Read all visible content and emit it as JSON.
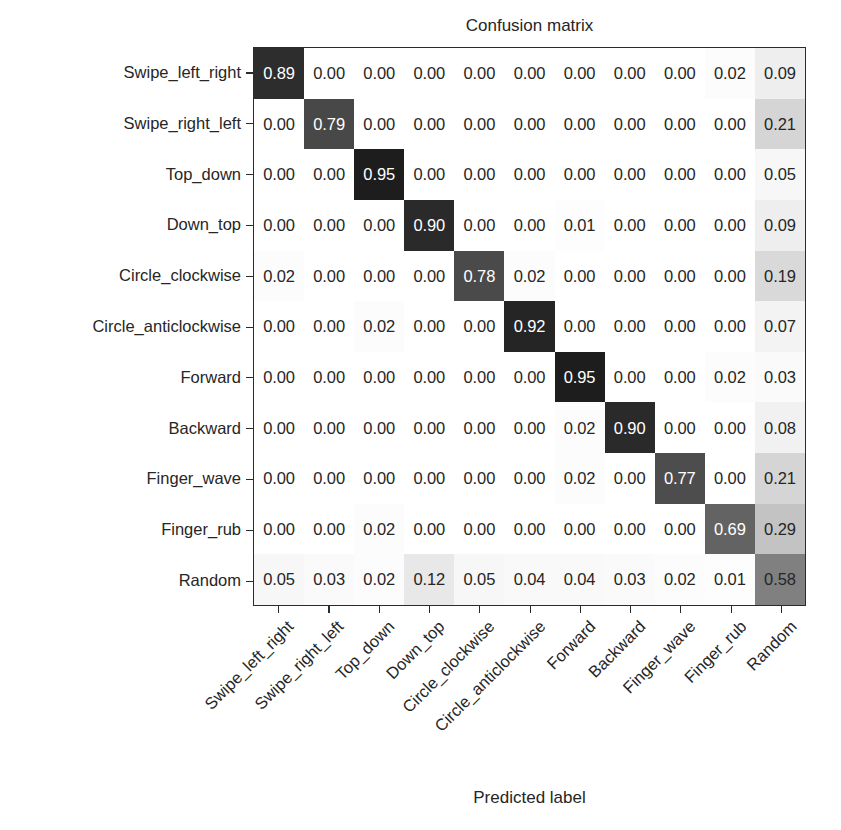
{
  "chart_data": {
    "type": "heatmap",
    "title": "Confusion matrix",
    "xlabel": "Predicted label",
    "ylabel": "True label",
    "colormap": "Greys",
    "normalized": true,
    "vmin": 0.0,
    "vmax": 1.0,
    "grid": false,
    "legend": "none",
    "categories": [
      "Swipe_left_right",
      "Swipe_right_left",
      "Top_down",
      "Down_top",
      "Circle_clockwise",
      "Circle_anticlockwise",
      "Forward",
      "Backward",
      "Finger_wave",
      "Finger_rub",
      "Random"
    ],
    "x_tick_labels": [
      "Swipe_left_right",
      "Swipe_right_left",
      "Top_down",
      "Down_top",
      "Circle_clockwise",
      "Circle_anticlockwise",
      "Forward",
      "Backward",
      "Finger_wave",
      "Finger_rub",
      "Random"
    ],
    "y_tick_labels": [
      "Swipe_left_right",
      "Swipe_right_left",
      "Top_down",
      "Down_top",
      "Circle_clockwise",
      "Circle_anticlockwise",
      "Forward",
      "Backward",
      "Finger_wave",
      "Finger_rub",
      "Random"
    ],
    "x_tick_rotation_deg": -45,
    "values": [
      [
        0.89,
        0.0,
        0.0,
        0.0,
        0.0,
        0.0,
        0.0,
        0.0,
        0.0,
        0.02,
        0.09
      ],
      [
        0.0,
        0.79,
        0.0,
        0.0,
        0.0,
        0.0,
        0.0,
        0.0,
        0.0,
        0.0,
        0.21
      ],
      [
        0.0,
        0.0,
        0.95,
        0.0,
        0.0,
        0.0,
        0.0,
        0.0,
        0.0,
        0.0,
        0.05
      ],
      [
        0.0,
        0.0,
        0.0,
        0.9,
        0.0,
        0.0,
        0.01,
        0.0,
        0.0,
        0.0,
        0.09
      ],
      [
        0.02,
        0.0,
        0.0,
        0.0,
        0.78,
        0.02,
        0.0,
        0.0,
        0.0,
        0.0,
        0.19
      ],
      [
        0.0,
        0.0,
        0.02,
        0.0,
        0.0,
        0.92,
        0.0,
        0.0,
        0.0,
        0.0,
        0.07
      ],
      [
        0.0,
        0.0,
        0.0,
        0.0,
        0.0,
        0.0,
        0.95,
        0.0,
        0.0,
        0.02,
        0.03
      ],
      [
        0.0,
        0.0,
        0.0,
        0.0,
        0.0,
        0.0,
        0.02,
        0.9,
        0.0,
        0.0,
        0.08
      ],
      [
        0.0,
        0.0,
        0.0,
        0.0,
        0.0,
        0.0,
        0.02,
        0.0,
        0.77,
        0.0,
        0.21
      ],
      [
        0.0,
        0.0,
        0.02,
        0.0,
        0.0,
        0.0,
        0.0,
        0.0,
        0.0,
        0.69,
        0.29
      ],
      [
        0.05,
        0.03,
        0.02,
        0.12,
        0.05,
        0.04,
        0.04,
        0.03,
        0.02,
        0.01,
        0.58
      ]
    ],
    "cell_text": [
      [
        "0.89",
        "0.00",
        "0.00",
        "0.00",
        "0.00",
        "0.00",
        "0.00",
        "0.00",
        "0.00",
        "0.02",
        "0.09"
      ],
      [
        "0.00",
        "0.79",
        "0.00",
        "0.00",
        "0.00",
        "0.00",
        "0.00",
        "0.00",
        "0.00",
        "0.00",
        "0.21"
      ],
      [
        "0.00",
        "0.00",
        "0.95",
        "0.00",
        "0.00",
        "0.00",
        "0.00",
        "0.00",
        "0.00",
        "0.00",
        "0.05"
      ],
      [
        "0.00",
        "0.00",
        "0.00",
        "0.90",
        "0.00",
        "0.00",
        "0.01",
        "0.00",
        "0.00",
        "0.00",
        "0.09"
      ],
      [
        "0.02",
        "0.00",
        "0.00",
        "0.00",
        "0.78",
        "0.02",
        "0.00",
        "0.00",
        "0.00",
        "0.00",
        "0.19"
      ],
      [
        "0.00",
        "0.00",
        "0.02",
        "0.00",
        "0.00",
        "0.92",
        "0.00",
        "0.00",
        "0.00",
        "0.00",
        "0.07"
      ],
      [
        "0.00",
        "0.00",
        "0.00",
        "0.00",
        "0.00",
        "0.00",
        "0.95",
        "0.00",
        "0.00",
        "0.02",
        "0.03"
      ],
      [
        "0.00",
        "0.00",
        "0.00",
        "0.00",
        "0.00",
        "0.00",
        "0.02",
        "0.90",
        "0.00",
        "0.00",
        "0.08"
      ],
      [
        "0.00",
        "0.00",
        "0.00",
        "0.00",
        "0.00",
        "0.00",
        "0.02",
        "0.00",
        "0.77",
        "0.00",
        "0.21"
      ],
      [
        "0.00",
        "0.00",
        "0.02",
        "0.00",
        "0.00",
        "0.00",
        "0.00",
        "0.00",
        "0.00",
        "0.69",
        "0.29"
      ],
      [
        "0.05",
        "0.03",
        "0.02",
        "0.12",
        "0.05",
        "0.04",
        "0.04",
        "0.03",
        "0.02",
        "0.01",
        "0.58"
      ]
    ],
    "colors": {
      "text_dark": "#262626",
      "text_light": "#ffffff",
      "axis_line": "#2b2b2b",
      "background": "#ffffff"
    }
  }
}
